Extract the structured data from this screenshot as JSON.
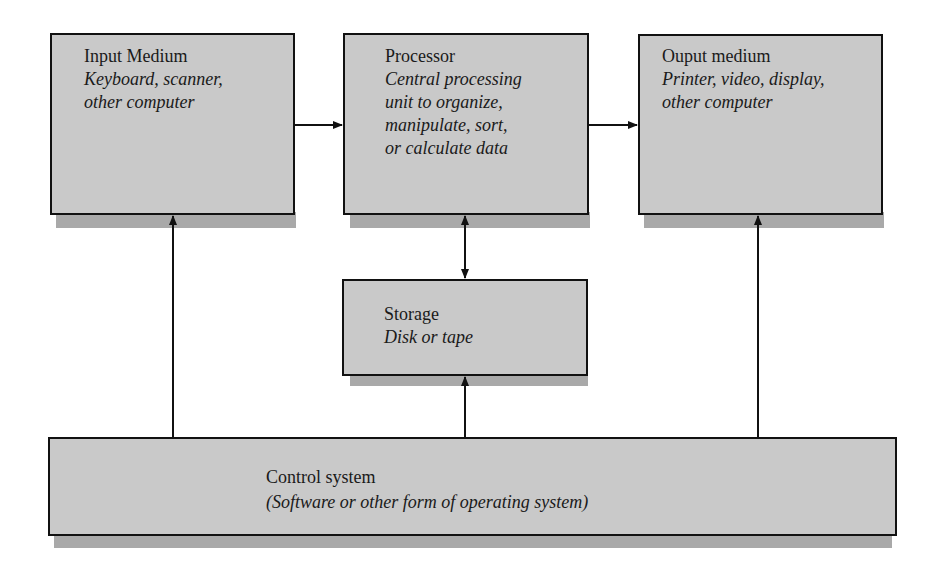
{
  "diagram": {
    "type": "block-diagram",
    "nodes": {
      "input": {
        "title": "Input Medium",
        "desc": "Keyboard, scanner,\nother computer"
      },
      "processor": {
        "title": "Processor",
        "desc": "Central processing\nunit to organize,\nmanipulate, sort,\nor calculate data"
      },
      "output": {
        "title": "Ouput medium",
        "desc": "Printer, video, display,\nother computer"
      },
      "storage": {
        "title": "Storage",
        "desc": "Disk or tape"
      },
      "control": {
        "title": "Control system",
        "desc": "(Software or other form of operating system)"
      }
    },
    "edges": [
      {
        "from": "input",
        "to": "processor",
        "direction": "one-way"
      },
      {
        "from": "processor",
        "to": "output",
        "direction": "one-way"
      },
      {
        "from": "processor",
        "to": "storage",
        "direction": "two-way"
      },
      {
        "from": "control",
        "to": "input",
        "direction": "one-way"
      },
      {
        "from": "control",
        "to": "storage",
        "direction": "one-way"
      },
      {
        "from": "control",
        "to": "output",
        "direction": "one-way"
      }
    ],
    "colors": {
      "box_fill": "#c9c9c9",
      "shadow": "#a9a9a9",
      "border": "#111111",
      "background": "#ffffff"
    }
  }
}
